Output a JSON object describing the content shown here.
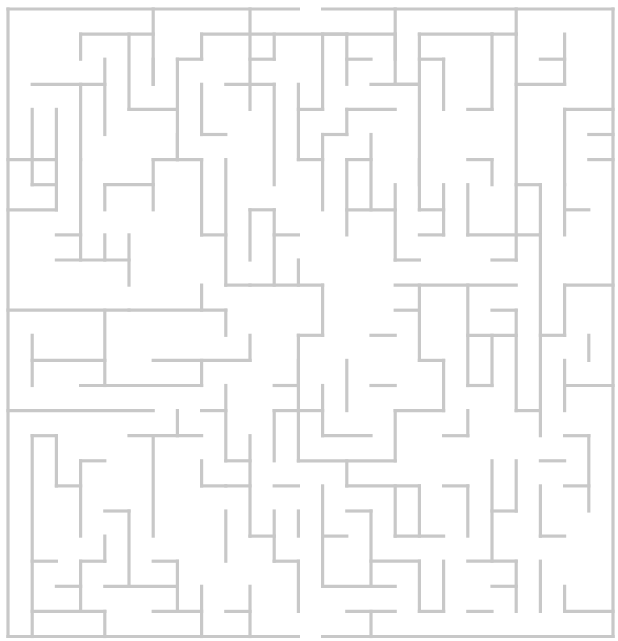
{
  "puzzle": {
    "type": "maze",
    "title": "Maze",
    "wall_color": "#c8c8c8",
    "background": "#ffffff",
    "grid": {
      "cols": 25,
      "rows": 25,
      "origin_x": 8,
      "origin_y": 9,
      "cell_w": 24.2,
      "cell_h": 25.1
    },
    "entrance": {
      "side": "top",
      "col": 12
    },
    "exit": {
      "side": "bottom",
      "col": 12
    },
    "walls": [
      [
        0,
        0,
        12,
        0
      ],
      [
        13,
        0,
        25,
        0
      ],
      [
        25,
        0,
        25,
        25
      ],
      [
        0,
        25,
        12,
        25
      ],
      [
        13,
        25,
        25,
        25
      ],
      [
        0,
        0,
        0,
        25
      ],
      [
        6,
        0,
        6,
        3
      ],
      [
        3,
        1,
        6,
        1
      ],
      [
        3,
        1,
        3,
        2
      ],
      [
        1,
        3,
        4,
        3
      ],
      [
        4,
        2,
        4,
        5
      ],
      [
        3,
        3,
        3,
        6
      ],
      [
        1,
        4,
        1,
        7
      ],
      [
        5,
        1,
        5,
        4
      ],
      [
        5,
        4,
        7,
        4
      ],
      [
        7,
        2,
        7,
        6
      ],
      [
        6,
        2,
        6,
        3
      ],
      [
        7,
        2,
        8,
        2
      ],
      [
        8,
        1,
        8,
        2
      ],
      [
        8,
        1,
        16,
        1
      ],
      [
        10,
        0,
        10,
        4
      ],
      [
        10,
        2,
        11,
        2
      ],
      [
        9,
        3,
        11,
        3
      ],
      [
        11,
        3,
        11,
        7
      ],
      [
        11,
        1,
        11,
        2
      ],
      [
        8,
        3,
        8,
        5
      ],
      [
        8,
        5,
        9,
        5
      ],
      [
        13,
        1,
        13,
        4
      ],
      [
        13,
        1,
        14,
        1
      ],
      [
        14,
        2,
        15,
        2
      ],
      [
        12,
        3,
        12,
        6
      ],
      [
        12,
        6,
        13,
        6
      ],
      [
        12,
        4,
        13,
        4
      ],
      [
        16,
        0,
        16,
        3
      ],
      [
        16,
        3,
        17,
        3
      ],
      [
        16,
        1,
        16,
        2
      ],
      [
        14,
        1,
        14,
        3
      ],
      [
        17,
        1,
        20,
        1
      ],
      [
        17,
        1,
        17,
        7
      ],
      [
        20,
        1,
        20,
        4
      ],
      [
        18,
        2,
        18,
        4
      ],
      [
        17,
        2,
        18,
        2
      ],
      [
        15,
        3,
        17,
        3
      ],
      [
        14,
        4,
        16,
        4
      ],
      [
        14,
        4,
        14,
        5
      ],
      [
        19,
        4,
        20,
        4
      ],
      [
        20,
        1,
        21,
        1
      ],
      [
        21,
        0,
        21,
        1
      ],
      [
        21,
        1,
        21,
        10
      ],
      [
        23,
        1,
        23,
        3
      ],
      [
        22,
        2,
        23,
        2
      ],
      [
        21,
        3,
        23,
        3
      ],
      [
        24,
        5,
        25,
        5
      ],
      [
        23,
        4,
        25,
        4
      ],
      [
        23,
        4,
        23,
        7
      ],
      [
        24,
        6,
        25,
        6
      ],
      [
        21,
        7,
        22,
        7
      ],
      [
        22,
        7,
        22,
        9
      ],
      [
        0,
        6,
        2,
        6
      ],
      [
        2,
        4,
        2,
        8
      ],
      [
        1,
        7,
        2,
        7
      ],
      [
        0,
        8,
        2,
        8
      ],
      [
        2,
        9,
        3,
        9
      ],
      [
        3,
        6,
        3,
        10
      ],
      [
        4,
        9,
        4,
        10
      ],
      [
        2,
        10,
        5,
        10
      ],
      [
        5,
        9,
        5,
        11
      ],
      [
        4,
        7,
        4,
        8
      ],
      [
        4,
        7,
        6,
        7
      ],
      [
        6,
        6,
        6,
        8
      ],
      [
        7,
        5,
        7,
        6
      ],
      [
        6,
        6,
        8,
        6
      ],
      [
        8,
        6,
        8,
        9
      ],
      [
        8,
        9,
        9,
        9
      ],
      [
        9,
        6,
        9,
        11
      ],
      [
        9,
        11,
        10,
        11
      ],
      [
        5,
        12,
        9,
        12
      ],
      [
        9,
        12,
        9,
        13
      ],
      [
        8,
        11,
        8,
        12
      ],
      [
        10,
        8,
        10,
        10
      ],
      [
        10,
        8,
        11,
        8
      ],
      [
        11,
        8,
        11,
        11
      ],
      [
        11,
        9,
        12,
        9
      ],
      [
        10,
        11,
        13,
        11
      ],
      [
        12,
        10,
        12,
        11
      ],
      [
        13,
        5,
        13,
        8
      ],
      [
        13,
        5,
        14,
        5
      ],
      [
        14,
        6,
        14,
        9
      ],
      [
        14,
        6,
        15,
        6
      ],
      [
        15,
        5,
        15,
        8
      ],
      [
        14,
        8,
        16,
        8
      ],
      [
        16,
        7,
        16,
        10
      ],
      [
        12,
        13,
        13,
        13
      ],
      [
        13,
        11,
        13,
        13
      ],
      [
        12,
        13,
        12,
        18
      ],
      [
        12,
        18,
        16,
        18
      ],
      [
        17,
        6,
        17,
        8
      ],
      [
        17,
        8,
        18,
        8
      ],
      [
        18,
        7,
        18,
        9
      ],
      [
        17,
        9,
        18,
        9
      ],
      [
        19,
        7,
        19,
        9
      ],
      [
        19,
        9,
        22,
        9
      ],
      [
        22,
        9,
        22,
        17
      ],
      [
        19,
        6,
        20,
        6
      ],
      [
        20,
        6,
        20,
        7
      ],
      [
        20,
        10,
        21,
        10
      ],
      [
        23,
        7,
        23,
        9
      ],
      [
        23,
        8,
        24,
        8
      ],
      [
        23,
        11,
        25,
        11
      ],
      [
        23,
        11,
        23,
        13
      ],
      [
        22,
        13,
        23,
        13
      ],
      [
        16,
        10,
        17,
        10
      ],
      [
        16,
        11,
        21,
        11
      ],
      [
        16,
        12,
        17,
        12
      ],
      [
        17,
        11,
        17,
        14
      ],
      [
        17,
        14,
        18,
        14
      ],
      [
        18,
        14,
        18,
        16
      ],
      [
        19,
        11,
        19,
        15
      ],
      [
        19,
        13,
        21,
        13
      ],
      [
        20,
        13,
        20,
        15
      ],
      [
        19,
        15,
        20,
        15
      ],
      [
        20,
        12,
        21,
        12
      ],
      [
        21,
        12,
        21,
        16
      ],
      [
        21,
        16,
        22,
        16
      ],
      [
        0,
        12,
        5,
        12
      ],
      [
        1,
        13,
        1,
        15
      ],
      [
        1,
        14,
        4,
        14
      ],
      [
        4,
        12,
        4,
        15
      ],
      [
        3,
        15,
        8,
        15
      ],
      [
        8,
        14,
        8,
        15
      ],
      [
        6,
        14,
        10,
        14
      ],
      [
        10,
        13,
        10,
        14
      ],
      [
        0,
        16,
        6,
        16
      ],
      [
        1,
        17,
        1,
        25
      ],
      [
        1,
        17,
        2,
        17
      ],
      [
        2,
        17,
        2,
        19
      ],
      [
        2,
        19,
        3,
        19
      ],
      [
        3,
        18,
        3,
        21
      ],
      [
        3,
        18,
        4,
        18
      ],
      [
        6,
        17,
        6,
        21
      ],
      [
        5,
        17,
        8,
        17
      ],
      [
        7,
        16,
        7,
        17
      ],
      [
        8,
        16,
        9,
        16
      ],
      [
        9,
        15,
        9,
        18
      ],
      [
        9,
        18,
        10,
        18
      ],
      [
        10,
        17,
        10,
        21
      ],
      [
        9,
        19,
        10,
        19
      ],
      [
        12,
        14,
        12,
        15
      ],
      [
        11,
        15,
        12,
        15
      ],
      [
        11,
        16,
        12,
        16
      ],
      [
        11,
        16,
        11,
        18
      ],
      [
        8,
        18,
        8,
        19
      ],
      [
        8,
        19,
        9,
        19
      ],
      [
        9,
        20,
        9,
        22
      ],
      [
        4,
        20,
        5,
        20
      ],
      [
        5,
        20,
        5,
        23
      ],
      [
        3,
        22,
        4,
        22
      ],
      [
        3,
        22,
        3,
        24
      ],
      [
        2,
        23,
        3,
        23
      ],
      [
        4,
        23,
        7,
        23
      ],
      [
        7,
        22,
        7,
        24
      ],
      [
        6,
        22,
        7,
        22
      ],
      [
        4,
        21,
        4,
        22
      ],
      [
        1,
        22,
        2,
        22
      ],
      [
        1,
        24,
        4,
        24
      ],
      [
        4,
        24,
        4,
        25
      ],
      [
        6,
        24,
        8,
        24
      ],
      [
        8,
        23,
        8,
        25
      ],
      [
        9,
        24,
        10,
        24
      ],
      [
        10,
        23,
        10,
        25
      ],
      [
        11,
        22,
        12,
        22
      ],
      [
        12,
        22,
        12,
        24
      ],
      [
        11,
        20,
        11,
        22
      ],
      [
        10,
        21,
        11,
        21
      ],
      [
        13,
        19,
        13,
        23
      ],
      [
        13,
        21,
        14,
        21
      ],
      [
        14,
        20,
        15,
        20
      ],
      [
        15,
        20,
        15,
        23
      ],
      [
        16,
        19,
        16,
        21
      ],
      [
        13,
        23,
        16,
        23
      ],
      [
        15,
        22,
        17,
        22
      ],
      [
        17,
        22,
        17,
        24
      ],
      [
        17,
        24,
        18,
        24
      ],
      [
        18,
        22,
        18,
        24
      ],
      [
        12,
        16,
        13,
        16
      ],
      [
        13,
        15,
        13,
        17
      ],
      [
        13,
        17,
        15,
        17
      ],
      [
        14,
        18,
        14,
        19
      ],
      [
        14,
        19,
        17,
        19
      ],
      [
        17,
        19,
        17,
        21
      ],
      [
        16,
        21,
        18,
        21
      ],
      [
        18,
        19,
        19,
        19
      ],
      [
        19,
        19,
        19,
        21
      ],
      [
        20,
        18,
        20,
        22
      ],
      [
        20,
        20,
        21,
        20
      ],
      [
        21,
        18,
        21,
        20
      ],
      [
        22,
        19,
        22,
        21
      ],
      [
        22,
        21,
        23,
        21
      ],
      [
        19,
        22,
        21,
        22
      ],
      [
        21,
        22,
        21,
        24
      ],
      [
        20,
        23,
        21,
        23
      ],
      [
        19,
        24,
        20,
        24
      ],
      [
        22,
        22,
        22,
        24
      ],
      [
        23,
        23,
        23,
        24
      ],
      [
        23,
        24,
        25,
        24
      ],
      [
        23,
        17,
        24,
        17
      ],
      [
        24,
        17,
        24,
        20
      ],
      [
        23,
        19,
        24,
        19
      ],
      [
        22,
        18,
        23,
        18
      ],
      [
        23,
        14,
        23,
        16
      ],
      [
        23,
        15,
        25,
        15
      ],
      [
        24,
        13,
        24,
        14
      ],
      [
        18,
        17,
        19,
        17
      ],
      [
        19,
        16,
        19,
        17
      ],
      [
        16,
        16,
        18,
        16
      ],
      [
        16,
        16,
        16,
        18
      ],
      [
        15,
        15,
        16,
        15
      ],
      [
        14,
        14,
        14,
        16
      ],
      [
        15,
        13,
        16,
        13
      ],
      [
        12,
        20,
        12,
        21
      ],
      [
        11,
        19,
        12,
        19
      ],
      [
        14,
        24,
        16,
        24
      ],
      [
        15,
        24,
        15,
        25
      ]
    ]
  }
}
